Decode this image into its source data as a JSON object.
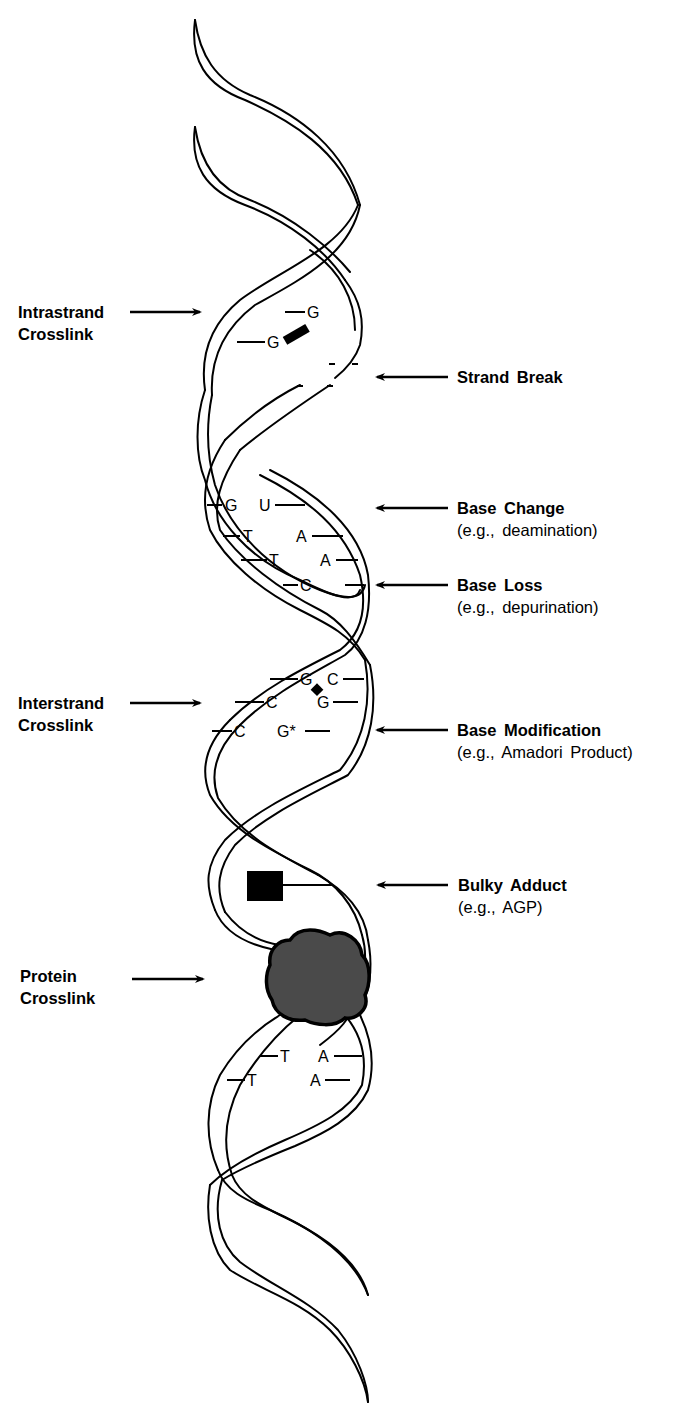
{
  "figure": {
    "type": "DNA double helix damage diagram",
    "left_labels": [
      {
        "id": "intrastrand",
        "title": "Intrastrand",
        "sub": "Crosslink"
      },
      {
        "id": "interstrand",
        "title": "Interstrand",
        "sub": "Crosslink"
      },
      {
        "id": "protein",
        "title": "Protein",
        "sub": "Crosslink"
      }
    ],
    "right_labels": [
      {
        "id": "strand-break",
        "title": "Strand  Break",
        "sub": ""
      },
      {
        "id": "base-change",
        "title": "Base  Change",
        "sub": "(e.g.,  deamination)"
      },
      {
        "id": "base-loss",
        "title": "Base  Loss",
        "sub": "(e.g.,  depurination)"
      },
      {
        "id": "base-modification",
        "title": "Base  Modification",
        "sub": "(e.g.,  Amadori  Product)"
      },
      {
        "id": "bulky-adduct",
        "title": "Bulky  Adduct",
        "sub": "(e.g.,  AGP)"
      }
    ],
    "bases": {
      "intrastrand": [
        "G",
        "G"
      ],
      "base_change": [
        "G",
        "U",
        "T",
        "A",
        "T",
        "A",
        "C"
      ],
      "interstrand": [
        "G",
        "C",
        "C",
        "G",
        "C",
        "G*"
      ],
      "lower_pair": [
        "T",
        "A",
        "T",
        "A"
      ]
    },
    "colors": {
      "line": "#000000",
      "protein_fill": "#4a4a4a",
      "background": "#ffffff"
    }
  }
}
